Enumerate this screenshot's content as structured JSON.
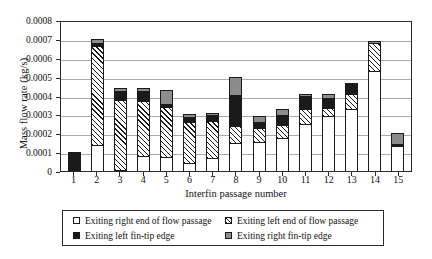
{
  "chart_data": {
    "type": "bar",
    "subtype": "stacked-bar",
    "title": "",
    "xlabel": "Interfin passage number",
    "ylabel": "Mass flow rate (kg/s)",
    "ylim": [
      0,
      0.0008
    ],
    "ytick_values": [
      0,
      0.0001,
      0.0002,
      0.0003,
      0.0004,
      0.0005,
      0.0006,
      0.0007,
      0.0008
    ],
    "ytick_labels": [
      "0",
      "0.0001",
      "0.0002",
      "0.0003",
      "0.0004",
      "0.0005",
      "0.0006",
      "0.0007",
      "0.0008"
    ],
    "grid": true,
    "grid_axis": "y",
    "legend_position": "below",
    "categories": [
      "1",
      "2",
      "3",
      "4",
      "5",
      "6",
      "7",
      "8",
      "9",
      "10",
      "11",
      "12",
      "13",
      "14",
      "15"
    ],
    "series": [
      {
        "name": "Exiting right end of flow passage",
        "fill": "white",
        "color": "#ffffff",
        "values": [
          0.0,
          0.00014,
          5e-06,
          8e-05,
          7.5e-05,
          4.5e-05,
          7e-05,
          0.00015,
          0.000155,
          0.000175,
          0.00025,
          0.00029,
          0.00033,
          0.00053,
          0.00013
        ]
      },
      {
        "name": "Exiting left end of flow passage",
        "fill": "hatched",
        "color": "#ffffff",
        "values": [
          0.0,
          0.00052,
          0.00037,
          0.00029,
          0.000265,
          0.000215,
          0.000195,
          9e-05,
          7.5e-05,
          7e-05,
          8e-05,
          4.5e-05,
          8e-05,
          0.00015,
          0.0
        ]
      },
      {
        "name": "Exiting left fin-tip edge",
        "fill": "solid-black",
        "color": "#1a1a1a",
        "values": [
          0.0001,
          2e-05,
          4.5e-05,
          5.5e-05,
          1.5e-05,
          2.5e-05,
          3e-05,
          0.000165,
          3e-05,
          5e-05,
          6.5e-05,
          5e-05,
          5.5e-05,
          0.0,
          1.5e-05
        ]
      },
      {
        "name": "Exiting right fin-tip edge",
        "fill": "solid-gray",
        "color": "#8c8c8c",
        "values": [
          0.0,
          2e-05,
          1.5e-05,
          1.5e-05,
          7.5e-05,
          1.5e-05,
          1e-05,
          9.5e-05,
          3e-05,
          3.5e-05,
          1.5e-05,
          2.5e-05,
          0.0,
          1e-05,
          5.5e-05
        ]
      }
    ],
    "totals": [
      0.0001,
      0.0007,
      0.000435,
      0.00044,
      0.00043,
      0.0003,
      0.000305,
      0.0005,
      0.00029,
      0.00033,
      0.00041,
      0.00041,
      0.000465,
      0.00069,
      0.0002
    ]
  },
  "legend": {
    "items": [
      {
        "label": "Exiting right end of flow passage",
        "swatch": "white-square-icon"
      },
      {
        "label": "Exiting left end of flow passage",
        "swatch": "hatched-square-icon"
      },
      {
        "label": "Exiting left fin-tip edge",
        "swatch": "black-square-icon"
      },
      {
        "label": "Exiting right fin-tip edge",
        "swatch": "gray-square-icon"
      }
    ]
  }
}
